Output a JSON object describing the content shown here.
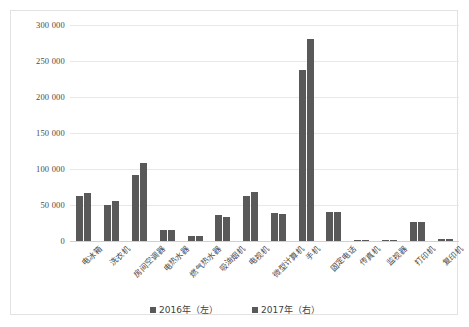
{
  "chart_data": {
    "type": "bar",
    "title": "",
    "xlabel": "",
    "ylabel": "",
    "ylim": [
      0,
      300000
    ],
    "ytick_step": 50000,
    "ytick_labels": [
      "300 000",
      "250 000",
      "200 000",
      "150 000",
      "100 000",
      "50 000",
      "0"
    ],
    "grid": true,
    "legend_position": "bottom",
    "bar_color": "#595959",
    "categories": [
      "电冰箱",
      "洗衣机",
      "房间空调器",
      "电热水器",
      "燃气热水器",
      "吸油烟机",
      "电视机",
      "微型计算机",
      "手机",
      "固定电话",
      "传真机",
      "监视器",
      "打印机",
      "复印机"
    ],
    "series": [
      {
        "name": "2016年（左）",
        "color": "#595959",
        "values": [
          63000,
          50000,
          92000,
          15000,
          6500,
          36000,
          62000,
          39000,
          237000,
          40000,
          900,
          1200,
          27000,
          3000
        ]
      },
      {
        "name": "2017年（右）",
        "color": "#595959",
        "values": [
          67000,
          55000,
          108000,
          15000,
          6500,
          33000,
          68000,
          38000,
          280000,
          40000,
          800,
          1000,
          27000,
          3000
        ]
      }
    ]
  }
}
